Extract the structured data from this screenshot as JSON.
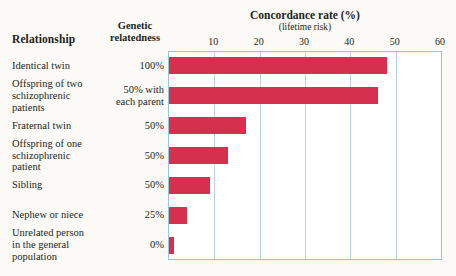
{
  "headers": {
    "relationship": "Relationship",
    "genetic_relatedness": "Genetic\nrelatedness",
    "genetic_relatedness_line1": "Genetic",
    "genetic_relatedness_line2": "relatedness"
  },
  "title": "Concordance rate (%)",
  "subtitle": "(lifetime risk)",
  "colors": {
    "bar": "#d6304f",
    "grid": "#b6d3e3",
    "frame": "#9dc3d8",
    "background": "#fbfaf7",
    "plot_background": "#ffffff",
    "text": "#231f20"
  },
  "chart_data": {
    "type": "bar",
    "orientation": "horizontal",
    "title": "Concordance rate (%)",
    "subtitle": "(lifetime risk)",
    "xlabel": "Concordance rate (%)",
    "ylabel": "Relationship",
    "xlim": [
      0,
      60
    ],
    "xticks": [
      10,
      20,
      30,
      40,
      50,
      60
    ],
    "grid": true,
    "legend": "none",
    "categories": [
      "Identical twin",
      "Offspring of two schizophrenic patients",
      "Fraternal twin",
      "Offspring of one schizophrenic patient",
      "Sibling",
      "Nephew or niece",
      "Unrelated person in the general population"
    ],
    "values": [
      48,
      46,
      17,
      13,
      9,
      4,
      1
    ],
    "genetic_relatedness": [
      "100%",
      "50% with each parent",
      "50%",
      "50%",
      "50%",
      "25%",
      "0%"
    ]
  },
  "rows": [
    {
      "label_lines": [
        "Identical twin"
      ],
      "label": "Identical twin",
      "relatedness_lines": [
        "100%"
      ],
      "relatedness": "100%",
      "value": 48
    },
    {
      "label_lines": [
        "Offspring of two",
        "schizophrenic",
        "patients"
      ],
      "label": "Offspring of two schizophrenic patients",
      "relatedness_lines": [
        "50% with",
        "each parent"
      ],
      "relatedness": "50% with each parent",
      "value": 46
    },
    {
      "label_lines": [
        "Fraternal twin"
      ],
      "label": "Fraternal twin",
      "relatedness_lines": [
        "50%"
      ],
      "relatedness": "50%",
      "value": 17
    },
    {
      "label_lines": [
        "Offspring of one",
        "schizophrenic",
        "patient"
      ],
      "label": "Offspring of one schizophrenic patient",
      "relatedness_lines": [
        "50%"
      ],
      "relatedness": "50%",
      "value": 13
    },
    {
      "label_lines": [
        "Sibling"
      ],
      "label": "Sibling",
      "relatedness_lines": [
        "50%"
      ],
      "relatedness": "50%",
      "value": 9
    },
    {
      "label_lines": [
        "Nephew or niece"
      ],
      "label": "Nephew or niece",
      "relatedness_lines": [
        "25%"
      ],
      "relatedness": "25%",
      "value": 4
    },
    {
      "label_lines": [
        "Unrelated person",
        "in the general",
        "population"
      ],
      "label": "Unrelated person in the general population",
      "relatedness_lines": [
        "0%"
      ],
      "relatedness": "0%",
      "value": 1
    }
  ]
}
